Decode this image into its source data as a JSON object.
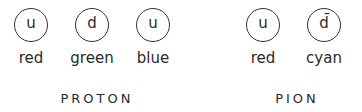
{
  "proton": {
    "label": "PROTON",
    "quarks": [
      {
        "flavor": "u",
        "color": "red"
      },
      {
        "flavor": "d",
        "color": "green"
      },
      {
        "flavor": "u",
        "color": "blue"
      }
    ]
  },
  "pion": {
    "label": "PION",
    "quarks": [
      {
        "flavor": "u",
        "color": "red"
      },
      {
        "flavor": "d̄",
        "color": "cyan"
      }
    ]
  }
}
